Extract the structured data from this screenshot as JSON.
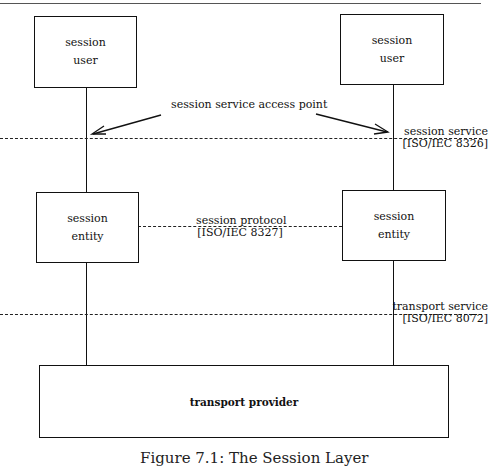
{
  "diagram": {
    "boxes": {
      "left_user": {
        "line1": "session",
        "line2": "user"
      },
      "right_user": {
        "line1": "session",
        "line2": "user"
      },
      "left_entity": {
        "line1": "session",
        "line2": "entity"
      },
      "right_entity": {
        "line1": "session",
        "line2": "entity"
      },
      "transport_provider": {
        "label": "transport provider"
      }
    },
    "labels": {
      "access_point": "session service access point",
      "session_service": "session service",
      "session_service_std": "[ISO/IEC 8326]",
      "session_protocol": "session protocol",
      "session_protocol_std": "[ISO/IEC 8327]",
      "transport_service": "transport service",
      "transport_service_std": "[ISO/IEC 8072]"
    },
    "caption": "Figure 7.1: The Session Layer",
    "colors": {
      "line": "#111111",
      "background": "#ffffff"
    }
  }
}
